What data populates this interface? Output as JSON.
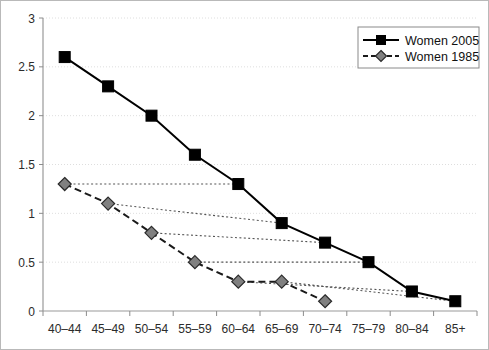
{
  "chart_data": {
    "type": "line",
    "title": "",
    "xlabel": "",
    "ylabel": "",
    "grid": true,
    "legend_position": "top-right",
    "ylim": [
      0,
      3
    ],
    "yticks": [
      "0",
      "0.5",
      "1",
      "1.5",
      "2",
      "2.5",
      "3"
    ],
    "ytick_values": [
      0,
      0.5,
      1,
      1.5,
      2,
      2.5,
      3
    ],
    "categories": [
      "40–44",
      "45–49",
      "50–54",
      "55–59",
      "60–64",
      "65–69",
      "70–74",
      "75–79",
      "80–84",
      "85+"
    ],
    "series": [
      {
        "name": "Women 2005",
        "marker": "square",
        "marker_color": "#000000",
        "line_style": "solid",
        "line_color": "#000000",
        "values": [
          2.6,
          2.3,
          2.0,
          1.6,
          1.3,
          0.9,
          0.7,
          0.5,
          0.2,
          0.1
        ]
      },
      {
        "name": "Women 1985",
        "marker": "diamond",
        "marker_color": "#808080",
        "line_style": "dashed",
        "line_color": "#1a1a1a",
        "values": [
          1.3,
          1.1,
          0.8,
          0.5,
          0.3,
          0.3,
          0.1,
          null,
          null,
          null
        ]
      }
    ],
    "cohort_connectors": [
      {
        "from_category": "40–44",
        "from_value": 1.3,
        "to_category": "60–64",
        "to_value": 1.3
      },
      {
        "from_category": "45–49",
        "from_value": 1.1,
        "to_category": "65–69",
        "to_value": 0.9
      },
      {
        "from_category": "50–54",
        "from_value": 0.8,
        "to_category": "70–74",
        "to_value": 0.7
      },
      {
        "from_category": "55–59",
        "from_value": 0.5,
        "to_category": "75–79",
        "to_value": 0.5
      },
      {
        "from_category": "60–64",
        "from_value": 0.3,
        "to_category": "80–84",
        "to_value": 0.2
      },
      {
        "from_category": "65–69",
        "from_value": 0.3,
        "to_category": "85+",
        "to_value": 0.1
      }
    ],
    "colors": {
      "grid": "#dedede",
      "axis": "#999999",
      "series_2005": "#000000",
      "series_1985_marker": "#808080",
      "connector": "#555555",
      "background": "#ffffff",
      "border": "#b9b9b9"
    }
  },
  "legend": {
    "items": [
      {
        "label": "Women 2005"
      },
      {
        "label": "Women 1985"
      }
    ]
  }
}
